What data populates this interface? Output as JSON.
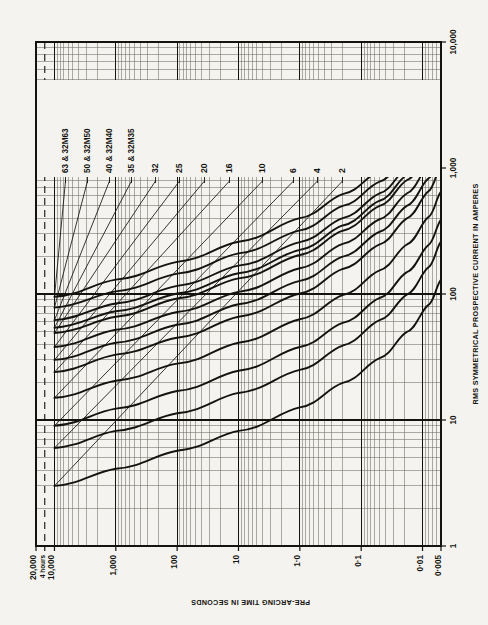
{
  "figure": {
    "background_color": "#f4f3ef",
    "ink_color": "#15130f",
    "grid_color": "#6e6a62",
    "orientation_note": "chart printed rotated 90 degrees clockwise on the page"
  },
  "axes": {
    "time_axis": {
      "title": "PRE-ARCING TIME IN SECONDS",
      "scale": "log",
      "min": 0.005,
      "max": 20000,
      "ticks": [
        {
          "value": 20000,
          "label": "20,000"
        },
        {
          "value": 14400,
          "label": "4 hours"
        },
        {
          "value": 10000,
          "label": "10,000"
        },
        {
          "value": 1000,
          "label": "1,000"
        },
        {
          "value": 100,
          "label": "100"
        },
        {
          "value": 10,
          "label": "10"
        },
        {
          "value": 1,
          "label": "1·0"
        },
        {
          "value": 0.1,
          "label": "0·1"
        },
        {
          "value": 0.01,
          "label": "0·01"
        },
        {
          "value": 0.005,
          "label": "0·005"
        }
      ]
    },
    "current_axis": {
      "title": "RMS SYMMETRICAL PROSPECTIVE CURRENT IN AMPERES",
      "scale": "log",
      "min": 1,
      "max": 10000,
      "ticks": [
        {
          "value": 1,
          "label": "1"
        },
        {
          "value": 10,
          "label": "10"
        },
        {
          "value": 100,
          "label": "100"
        },
        {
          "value": 1000,
          "label": "1,000"
        },
        {
          "value": 10000,
          "label": "10,000"
        }
      ]
    }
  },
  "curve_labels": [
    {
      "id": "c63",
      "label": "63 & 32M63"
    },
    {
      "id": "c50",
      "label": "50 & 32M50"
    },
    {
      "id": "c40",
      "label": "40 & 32M40"
    },
    {
      "id": "c35",
      "label": "35 & 32M35"
    },
    {
      "id": "c32",
      "label": "32"
    },
    {
      "id": "c25",
      "label": "25"
    },
    {
      "id": "c20",
      "label": "20"
    },
    {
      "id": "c16",
      "label": "16"
    },
    {
      "id": "c10",
      "label": "10"
    },
    {
      "id": "c6",
      "label": "6"
    },
    {
      "id": "c4",
      "label": "4"
    },
    {
      "id": "c2",
      "label": "2"
    }
  ],
  "chart_data": {
    "type": "line",
    "title": "",
    "xlabel": "RMS SYMMETRICAL PROSPECTIVE CURRENT IN AMPERES",
    "ylabel": "PRE-ARCING TIME IN SECONDS",
    "xscale": "log",
    "yscale": "log",
    "xlim": [
      1,
      10000
    ],
    "ylim": [
      0.005,
      20000
    ],
    "grid": true,
    "grid_style": "log minor grid both axes",
    "legend": "inline curve labels at top of plot",
    "annotations": [
      {
        "text": "4 hours",
        "y_value": 14400,
        "style": "dashed horizontal reference line"
      }
    ],
    "series": [
      {
        "name": "63 & 32M63",
        "x": [
          95,
          130,
          180,
          260,
          400,
          620,
          950,
          1500,
          2400,
          3800
        ],
        "y": [
          10000,
          1000,
          100,
          10,
          1.0,
          0.2,
          0.05,
          0.018,
          0.008,
          0.005
        ]
      },
      {
        "name": "50 & 32M50",
        "x": [
          78,
          105,
          145,
          210,
          320,
          500,
          780,
          1250,
          2000,
          3200
        ],
        "y": [
          10000,
          1000,
          100,
          10,
          1.0,
          0.2,
          0.05,
          0.018,
          0.008,
          0.005
        ]
      },
      {
        "name": "40 & 32M40",
        "x": [
          62,
          84,
          116,
          168,
          258,
          400,
          630,
          1000,
          1650,
          2600
        ],
        "y": [
          10000,
          1000,
          100,
          10,
          1.0,
          0.2,
          0.05,
          0.018,
          0.008,
          0.005
        ]
      },
      {
        "name": "35 & 32M35",
        "x": [
          54,
          73,
          101,
          146,
          224,
          350,
          550,
          880,
          1450,
          2300
        ],
        "y": [
          10000,
          1000,
          100,
          10,
          1.0,
          0.2,
          0.05,
          0.018,
          0.008,
          0.005
        ]
      },
      {
        "name": "32",
        "x": [
          49,
          66,
          92,
          133,
          204,
          318,
          500,
          800,
          1320,
          2100
        ],
        "y": [
          10000,
          1000,
          100,
          10,
          1.0,
          0.2,
          0.05,
          0.018,
          0.008,
          0.005
        ]
      },
      {
        "name": "25",
        "x": [
          38,
          52,
          72,
          104,
          160,
          250,
          392,
          628,
          1040,
          1650
        ],
        "y": [
          10000,
          1000,
          100,
          10,
          1.0,
          0.2,
          0.05,
          0.018,
          0.008,
          0.005
        ]
      },
      {
        "name": "20",
        "x": [
          30,
          41,
          57,
          83,
          127,
          198,
          312,
          500,
          825,
          1310
        ],
        "y": [
          10000,
          1000,
          100,
          10,
          1.0,
          0.2,
          0.05,
          0.018,
          0.008,
          0.005
        ]
      },
      {
        "name": "16",
        "x": [
          24,
          33,
          45,
          66,
          101,
          158,
          248,
          398,
          655,
          1040
        ],
        "y": [
          10000,
          1000,
          100,
          10,
          1.0,
          0.2,
          0.05,
          0.018,
          0.008,
          0.005
        ]
      },
      {
        "name": "10",
        "x": [
          15,
          20.5,
          28,
          41,
          63,
          98,
          154,
          247,
          408,
          648
        ],
        "y": [
          10000,
          1000,
          100,
          10,
          1.0,
          0.2,
          0.05,
          0.018,
          0.008,
          0.005
        ]
      },
      {
        "name": "6",
        "x": [
          9,
          12.3,
          17,
          24.6,
          38,
          59,
          93,
          149,
          245,
          390
        ],
        "y": [
          10000,
          1000,
          100,
          10,
          1.0,
          0.2,
          0.05,
          0.018,
          0.008,
          0.005
        ]
      },
      {
        "name": "4",
        "x": [
          6,
          8.2,
          11.3,
          16.4,
          25,
          39,
          62,
          99,
          163,
          260
        ],
        "y": [
          10000,
          1000,
          100,
          10,
          1.0,
          0.2,
          0.05,
          0.018,
          0.008,
          0.005
        ]
      },
      {
        "name": "2",
        "x": [
          3,
          4.1,
          5.7,
          8.2,
          12.6,
          19.7,
          31,
          50,
          82,
          130
        ],
        "y": [
          10000,
          1000,
          100,
          10,
          1.0,
          0.2,
          0.05,
          0.018,
          0.008,
          0.005
        ]
      }
    ]
  }
}
